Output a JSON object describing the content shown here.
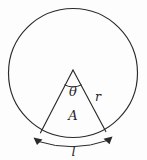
{
  "figure": {
    "background_color": "#fdfdfd",
    "stroke_color": "#2a2a2a",
    "label_color": "#262626",
    "labels": {
      "angle": "θ",
      "radius": "r",
      "area": "A",
      "arc_length": "l"
    },
    "geometry": {
      "circle": {
        "cx": 73,
        "cy": 73,
        "r": 64
      },
      "apex": {
        "x": 73,
        "y": 70
      },
      "base_left": {
        "x": 40.5,
        "y": 132.5
      },
      "base_right": {
        "x": 105.5,
        "y": 131.5
      },
      "angle_arc": {
        "cx": 73,
        "cy": 70,
        "r": 17,
        "start_deg": 62,
        "end_deg": 118
      },
      "dimension_arc": {
        "left_x": 36,
        "right_x": 110,
        "y": 143,
        "sag": 9
      }
    },
    "label_positions": {
      "angle": {
        "x": 73,
        "y": 95
      },
      "radius": {
        "x": 97,
        "y": 100
      },
      "area": {
        "x": 73,
        "y": 119
      },
      "arc_length": {
        "x": 73,
        "y": 155
      }
    }
  }
}
